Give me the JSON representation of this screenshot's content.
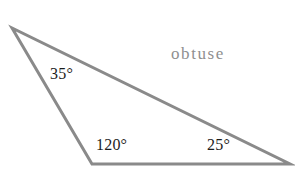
{
  "figure": {
    "title": "",
    "type_label": "obtuse",
    "type_label_color": "#8f8f8f",
    "background_color": "#ffffff",
    "stroke_color": "#8a8a8a",
    "stroke_width": 3,
    "label_color": "#1c1c1c",
    "degree_symbol": "°",
    "vertices": {
      "apex": {
        "name": "top-left-vertex",
        "x": 12,
        "y": 28
      },
      "bottom_left": {
        "name": "bottom-left-vertex",
        "x": 92,
        "y": 164
      },
      "bottom_right": {
        "name": "bottom-right-vertex",
        "x": 290,
        "y": 164
      }
    },
    "angles": [
      {
        "id": "a35",
        "value": 35,
        "text": "35°",
        "vertex": "top-left-vertex"
      },
      {
        "id": "a120",
        "value": 120,
        "text": "120°",
        "vertex": "bottom-left-vertex"
      },
      {
        "id": "a25",
        "value": 25,
        "text": "25°",
        "vertex": "bottom-right-vertex"
      }
    ]
  },
  "chart_data": {
    "type": "diagram",
    "shape": "triangle",
    "classification": "obtuse",
    "title": "",
    "angle_labels": [
      "35°",
      "120°",
      "25°"
    ],
    "angle_values": [
      35,
      120,
      25
    ],
    "angle_sum": 180,
    "polygon_points": "12,28 92,164 290,164"
  }
}
